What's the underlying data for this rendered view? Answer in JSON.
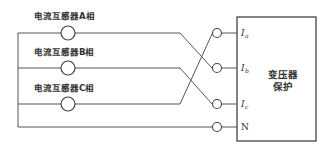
{
  "diagram": {
    "current_transformers": [
      {
        "label": "电流互感器A相",
        "phase": "A"
      },
      {
        "label": "电流互感器B相",
        "phase": "B"
      },
      {
        "label": "电流互感器C相",
        "phase": "C"
      }
    ],
    "terminals": [
      {
        "symbol": "I",
        "subscript": "a"
      },
      {
        "symbol": "I",
        "subscript": "b"
      },
      {
        "symbol": "I",
        "subscript": "c"
      },
      {
        "symbol": "N",
        "subscript": ""
      }
    ],
    "device": {
      "line1": "变压器",
      "line2": "保护"
    },
    "wiring": [
      {
        "from": "A",
        "to": "Ib"
      },
      {
        "from": "B",
        "to": "Ic"
      },
      {
        "from": "C",
        "to": "Ia"
      },
      {
        "from": "common",
        "to": "N"
      }
    ]
  }
}
